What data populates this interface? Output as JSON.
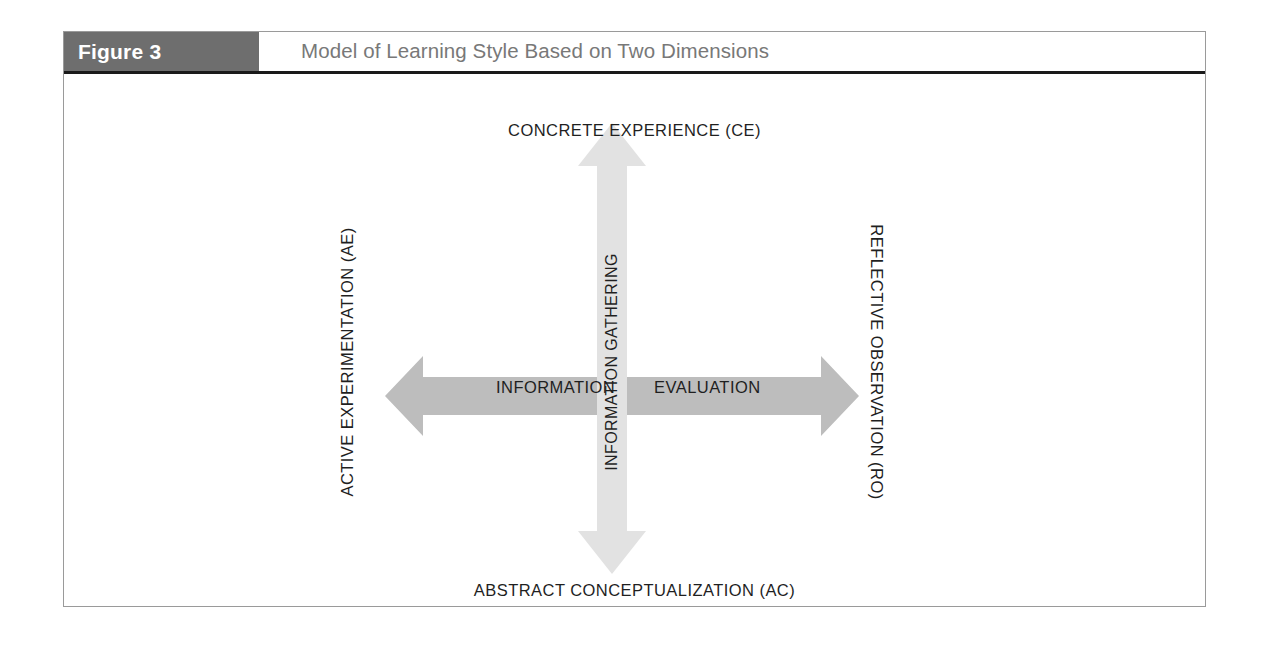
{
  "figure": {
    "number_label": "Figure 3",
    "title": "Model of Learning Style Based on Two Dimensions"
  },
  "diagram": {
    "type": "two-axis-quadrant-model",
    "vertical_axis": {
      "name": "Information Gathering",
      "shaft_label": "INFORMATION GATHERING",
      "top_pole": "CONCRETE EXPERIENCE (CE)",
      "bottom_pole": "ABSTRACT CONCEPTUALIZATION (AC)",
      "arrow_color": "#e2e2e2",
      "double_headed": true
    },
    "horizontal_axis": {
      "name": "Information Evaluation",
      "left_shaft_label": "INFORMATION",
      "right_shaft_label": "EVALUATION",
      "left_pole": "ACTIVE EXPERIMENTATION (AE)",
      "right_pole": "REFLECTIVE OBSERVATION (RO)",
      "arrow_color": "#bdbdbd",
      "double_headed": true
    }
  },
  "colors": {
    "figure_number_background": "#6e6e6e",
    "figure_number_text": "#ffffff",
    "title_text": "#787878",
    "frame_border": "#9a9a9a",
    "header_rule": "#1a1a1a",
    "label_text": "#1f1f1f",
    "horizontal_arrow": "#bdbdbd",
    "vertical_arrow": "#e2e2e2",
    "page_background": "#ffffff"
  }
}
